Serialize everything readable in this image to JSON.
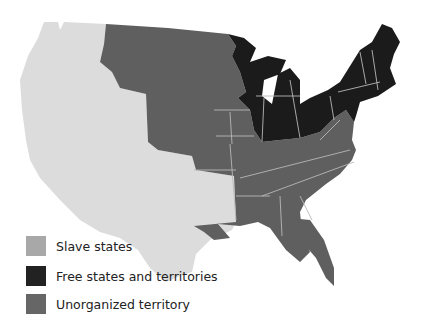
{
  "colors": {
    "slave": "#5f5f5f",
    "free": "#1b1b1b",
    "unorganized": "#dcdcdc",
    "border": "#b8b8b8",
    "legend_slave": "#a8a8a8",
    "legend_free": "#222222",
    "legend_unorganized": "#666666"
  },
  "legend": {
    "items": [
      {
        "label": "Slave states",
        "top": 236
      },
      {
        "label": "Free states and territories",
        "top": 266
      },
      {
        "label": "Unorganized territory",
        "top": 294
      }
    ]
  }
}
